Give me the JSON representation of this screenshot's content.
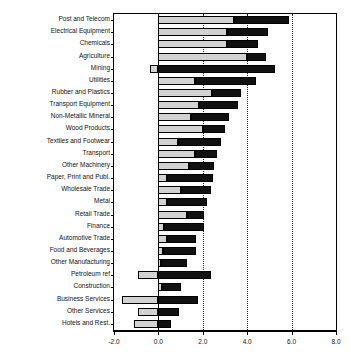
{
  "chart_data": {
    "type": "bar",
    "orientation": "horizontal",
    "stacked": true,
    "title": "",
    "subtitle": "",
    "xlabel": "",
    "ylabel": "",
    "xlim": [
      -2.0,
      8.0
    ],
    "xticks": [
      -2.0,
      0.0,
      2.0,
      4.0,
      6.0,
      8.0
    ],
    "xticklabels": [
      "-2.0",
      "0.0",
      "2.0",
      "4.0",
      "6.0",
      "8.0"
    ],
    "grid": "vertical dotted gridlines at 2.0, 4.0, 6.0",
    "legend": "none",
    "categories": [
      "Post and Telecom",
      "Electrical Equipment",
      "Chemicals",
      "Agriculture",
      "Mining",
      "Utilities",
      "Rubber and Plastics",
      "Transport Equipment",
      "Non-Metallic Mineral",
      "Wood Products",
      "Textiles and Footwear",
      "Transport",
      "Other Machinery",
      "Paper, Print and Publ.",
      "Wholesale Trade",
      "Metal",
      "Retail Trade",
      "Finance",
      "Automotive Trade",
      "Food and Beverages",
      "Other Manufacturing",
      "Petroleum ref",
      "Construction",
      "Business Services",
      "Other Services",
      "Hotels and Rest."
    ],
    "series": [
      {
        "name": "light-segment",
        "color": "#d2d2d2",
        "values": [
          3.4,
          3.1,
          3.1,
          4.0,
          -0.4,
          1.65,
          2.4,
          1.85,
          1.45,
          2.0,
          0.9,
          1.65,
          1.4,
          0.4,
          1.0,
          0.4,
          1.3,
          0.25,
          0.4,
          0.2,
          0.1,
          -0.9,
          0.15,
          -1.65,
          -0.9,
          -1.1
        ]
      },
      {
        "name": "dark-segment",
        "color": "#111111",
        "values": [
          2.5,
          1.85,
          1.4,
          0.85,
          5.25,
          2.75,
          1.3,
          1.75,
          1.75,
          1.0,
          1.9,
          1.0,
          1.1,
          2.05,
          1.35,
          1.8,
          0.75,
          1.8,
          1.3,
          1.5,
          1.2,
          2.35,
          0.85,
          1.8,
          0.95,
          0.55
        ]
      }
    ],
    "totals": [
      5.9,
      4.95,
      4.5,
      4.85,
      4.85,
      4.4,
      3.7,
      3.6,
      3.2,
      3.0,
      2.8,
      2.65,
      2.5,
      2.45,
      2.35,
      2.2,
      2.05,
      2.05,
      1.7,
      1.7,
      1.3,
      2.35,
      1.0,
      1.8,
      0.95,
      0.55
    ]
  }
}
